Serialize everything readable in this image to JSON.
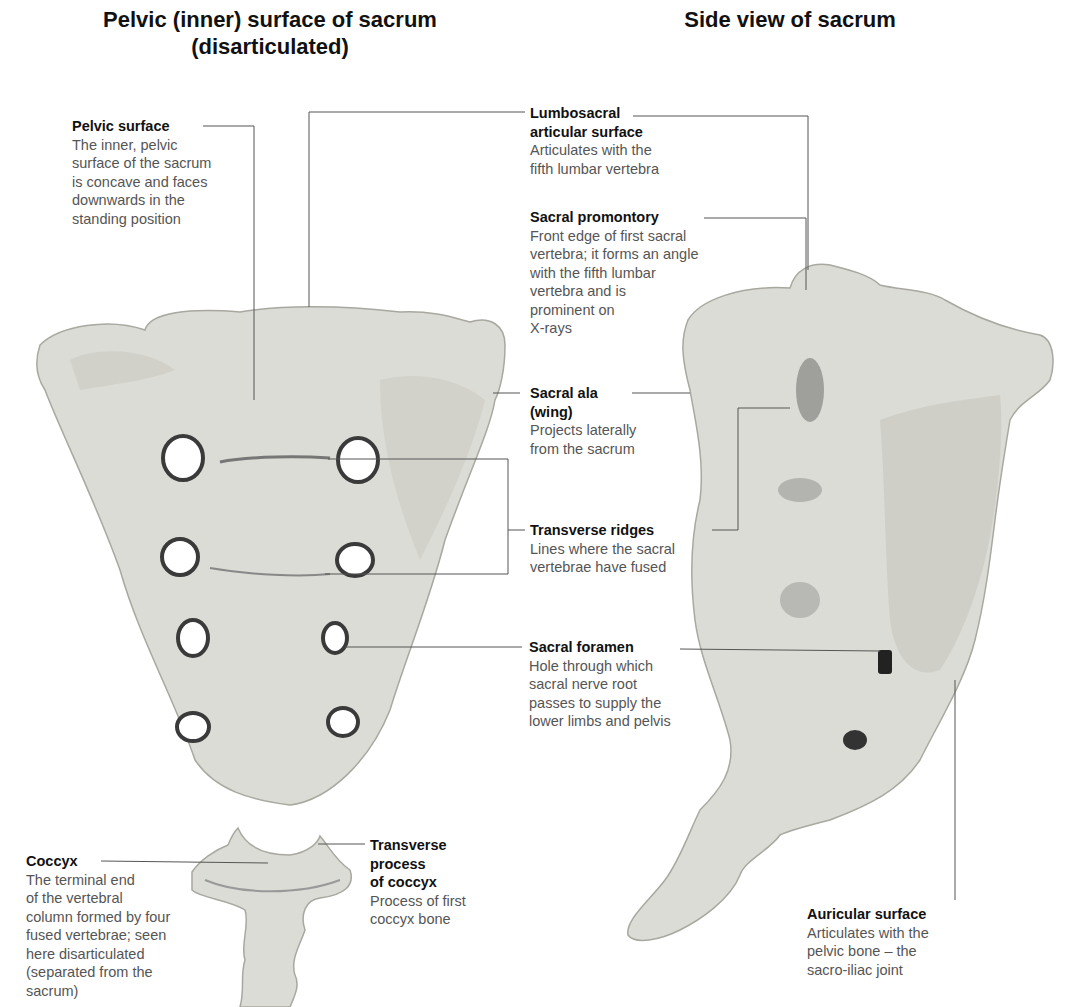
{
  "titles": {
    "left": "Pelvic (inner) surface of sacrum\n(disarticulated)",
    "left_line1": "Pelvic (inner) surface of sacrum",
    "left_line2": "(disarticulated)",
    "right": "Side view of sacrum"
  },
  "labels": {
    "pelvic_surface": {
      "heading": "Pelvic surface",
      "description": "The inner, pelvic\nsurface of the sacrum\nis concave and faces\ndownwards in the\nstanding position"
    },
    "lumbosacral": {
      "heading": "Lumbosacral\narticular surface",
      "description": "Articulates with the\nfifth lumbar vertebra"
    },
    "sacral_promontory": {
      "heading": "Sacral promontory",
      "description": "Front edge of first sacral\nvertebra; it forms an angle\nwith the fifth lumbar\nvertebra and is\nprominent on\nX-rays"
    },
    "sacral_ala": {
      "heading": "Sacral ala\n(wing)",
      "description": "Projects laterally\nfrom the sacrum"
    },
    "transverse_ridges": {
      "heading": "Transverse ridges",
      "description": "Lines where the sacral\nvertebrae have fused"
    },
    "sacral_foramen": {
      "heading": "Sacral foramen",
      "description": "Hole through which\nsacral nerve root\npasses to supply the\nlower limbs and pelvis"
    },
    "coccyx": {
      "heading": "Coccyx",
      "description": "The terminal end\nof the vertebral\ncolumn formed by four\nfused vertebrae; seen\nhere disarticulated\n(separated from the\nsacrum)"
    },
    "transverse_process": {
      "heading": "Transverse\nprocess\nof coccyx",
      "description": "Process of first\ncoccyx bone"
    },
    "auricular_surface": {
      "heading": "Auricular surface",
      "description": "Articulates with the\npelvic bone – the\nsacro-iliac joint"
    }
  },
  "figures": {
    "front_sacrum": "sacrum-pelvic-surface-photo",
    "coccyx": "coccyx-photo",
    "side_sacrum": "sacrum-side-view-photo"
  }
}
